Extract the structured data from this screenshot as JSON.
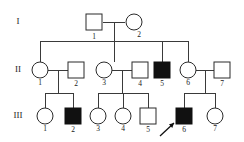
{
  "chart_data": {
    "type": "diagram",
    "diagram_kind": "pedigree",
    "generation_labels": [
      "I",
      "II",
      "III"
    ],
    "legend": {
      "square": "male",
      "circle": "female",
      "filled": "affected",
      "open": "unaffected",
      "arrow": "proband"
    },
    "generations": [
      {
        "label": "I",
        "label_x": 18,
        "label_y": 22,
        "row_y": 22,
        "individuals": [
          {
            "id": "I-1",
            "number": "1",
            "sex": "male",
            "shape": "square",
            "affected": false,
            "x": 94,
            "y": 22,
            "num_x": 94,
            "num_y": 33
          },
          {
            "id": "I-2",
            "number": "2",
            "sex": "female",
            "shape": "circle",
            "affected": false,
            "x": 134,
            "y": 22,
            "num_x": 139,
            "num_y": 31
          }
        ]
      },
      {
        "label": "II",
        "label_x": 18,
        "label_y": 70,
        "row_y": 70,
        "individuals": [
          {
            "id": "II-1",
            "number": "1",
            "sex": "female",
            "shape": "circle",
            "affected": false,
            "x": 40,
            "y": 70,
            "num_x": 40,
            "num_y": 79
          },
          {
            "id": "II-2",
            "number": "2",
            "sex": "male",
            "shape": "square",
            "affected": false,
            "x": 76,
            "y": 70,
            "num_x": 76,
            "num_y": 80
          },
          {
            "id": "II-3",
            "number": "3",
            "sex": "female",
            "shape": "circle",
            "affected": false,
            "x": 104,
            "y": 70,
            "num_x": 104,
            "num_y": 79
          },
          {
            "id": "II-4",
            "number": "4",
            "sex": "male",
            "shape": "square",
            "affected": false,
            "x": 140,
            "y": 70,
            "num_x": 140,
            "num_y": 80
          },
          {
            "id": "II-5",
            "number": "5",
            "sex": "male",
            "shape": "square",
            "affected": true,
            "x": 162,
            "y": 70,
            "num_x": 162,
            "num_y": 80
          },
          {
            "id": "II-6",
            "number": "6",
            "sex": "female",
            "shape": "circle",
            "affected": false,
            "x": 188,
            "y": 70,
            "num_x": 188,
            "num_y": 79
          },
          {
            "id": "II-7",
            "number": "7",
            "sex": "male",
            "shape": "square",
            "affected": false,
            "x": 222,
            "y": 70,
            "num_x": 222,
            "num_y": 80
          }
        ]
      },
      {
        "label": "III",
        "label_x": 18,
        "label_y": 116,
        "row_y": 116,
        "individuals": [
          {
            "id": "III-1",
            "number": "1",
            "sex": "female",
            "shape": "circle",
            "affected": false,
            "x": 45,
            "y": 116,
            "num_x": 45,
            "num_y": 125
          },
          {
            "id": "III-2",
            "number": "2",
            "sex": "male",
            "shape": "square",
            "affected": true,
            "x": 73,
            "y": 116,
            "num_x": 73,
            "num_y": 126
          },
          {
            "id": "III-3",
            "number": "3",
            "sex": "female",
            "shape": "circle",
            "affected": false,
            "x": 98,
            "y": 116,
            "num_x": 98,
            "num_y": 125
          },
          {
            "id": "III-4",
            "number": "4",
            "sex": "female",
            "shape": "circle",
            "affected": false,
            "x": 123,
            "y": 116,
            "num_x": 123,
            "num_y": 125
          },
          {
            "id": "III-5",
            "number": "5",
            "sex": "male",
            "shape": "square",
            "affected": false,
            "x": 148,
            "y": 116,
            "num_x": 148,
            "num_y": 126
          },
          {
            "id": "III-6",
            "number": "6",
            "sex": "male",
            "shape": "square",
            "affected": true,
            "proband": true,
            "x": 184,
            "y": 116,
            "num_x": 184,
            "num_y": 126
          },
          {
            "id": "III-7",
            "number": "7",
            "sex": "female",
            "shape": "circle",
            "affected": false,
            "x": 215,
            "y": 116,
            "num_x": 215,
            "num_y": 125
          }
        ]
      }
    ],
    "matings": [
      {
        "id": "mating-I1-I2",
        "parents": [
          "I-1",
          "I-2"
        ],
        "line_y": 22,
        "x1": 103,
        "x2": 125
      },
      {
        "id": "mating-II1-II2",
        "parents": [
          "II-1",
          "II-2"
        ],
        "line_y": 70,
        "x1": 48,
        "x2": 68
      },
      {
        "id": "mating-II3-II4",
        "parents": [
          "II-3",
          "II-4"
        ],
        "line_y": 70,
        "x1": 112,
        "x2": 132
      },
      {
        "id": "mating-II6-II7",
        "parents": [
          "II-6",
          "II-7"
        ],
        "line_y": 70,
        "x1": 196,
        "x2": 214
      }
    ],
    "sibships": [
      {
        "id": "sibship-gen-II",
        "parents": [
          "I-1",
          "I-2"
        ],
        "descent_x": 114,
        "descent_from_y": 22,
        "bar_y": 41,
        "bar_x1": 40,
        "bar_x2": 188,
        "children": [
          "II-1",
          "II-3",
          "II-5",
          "II-6"
        ],
        "child_drop_x": [
          40,
          114,
          162,
          188
        ]
      },
      {
        "id": "sibship-gen-III-a",
        "parents": [
          "II-1",
          "II-2"
        ],
        "descent_x": 58,
        "descent_from_y": 70,
        "bar_y": 93,
        "bar_x1": 45,
        "bar_x2": 73,
        "children": [
          "III-1",
          "III-2"
        ],
        "child_drop_x": [
          45,
          73
        ]
      },
      {
        "id": "sibship-gen-III-b",
        "parents": [
          "II-3",
          "II-4"
        ],
        "descent_x": 122,
        "descent_from_y": 70,
        "bar_y": 93,
        "bar_x1": 98,
        "bar_x2": 148,
        "children": [
          "III-3",
          "III-4",
          "III-5"
        ],
        "child_drop_x": [
          98,
          123,
          148
        ]
      },
      {
        "id": "sibship-gen-III-c",
        "parents": [
          "II-6",
          "II-7"
        ],
        "descent_x": 205,
        "descent_from_y": 70,
        "bar_y": 93,
        "bar_x1": 184,
        "bar_x2": 215,
        "children": [
          "III-6",
          "III-7"
        ],
        "child_drop_x": [
          184,
          215
        ]
      }
    ],
    "proband_arrow": {
      "target": "III-6",
      "x1": 160,
      "y1": 136,
      "x2": 174,
      "y2": 123
    },
    "symbol_size": {
      "square_side": 16,
      "circle_radius": 8
    },
    "counts": {
      "total_individuals": 16,
      "affected": 3,
      "affected_ids": [
        "II-5",
        "III-2",
        "III-6"
      ]
    }
  }
}
